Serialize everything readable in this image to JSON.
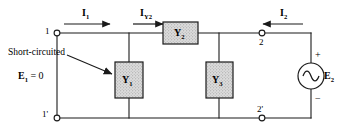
{
  "figure": {
    "type": "electrical-circuit-diagram",
    "background_color": "#ffffff",
    "line_color": "#1a1a1a",
    "component_fill": "#d9d9d9"
  },
  "terminals": [
    {
      "id": "t1",
      "label": "1",
      "x": 57,
      "y": 33,
      "side": "top-left"
    },
    {
      "id": "t1p",
      "label": "1'",
      "x": 57,
      "y": 118,
      "side": "bottom-left"
    },
    {
      "id": "t2",
      "label": "2",
      "x": 262,
      "y": 33,
      "side": "top-right"
    },
    {
      "id": "t2p",
      "label": "2'",
      "x": 262,
      "y": 118,
      "side": "bottom-right"
    }
  ],
  "currents": [
    {
      "id": "i1",
      "label": "I",
      "subscript": "1",
      "direction": "right",
      "x": 83,
      "y": 17
    },
    {
      "id": "iy2",
      "label": "I",
      "subscript": "Y2",
      "direction": "right",
      "x": 148,
      "y": 17
    },
    {
      "id": "i2",
      "label": "I",
      "subscript": "2",
      "direction": "left",
      "x": 283,
      "y": 17
    }
  ],
  "components": [
    {
      "id": "y1",
      "label": "Y",
      "subscript": "1",
      "orientation": "vertical",
      "x": 129,
      "y": 80
    },
    {
      "id": "y2",
      "label": "Y",
      "subscript": "2",
      "orientation": "horizontal",
      "x": 180,
      "y": 33
    },
    {
      "id": "y3",
      "label": "Y",
      "subscript": "3",
      "orientation": "vertical",
      "x": 219,
      "y": 80
    }
  ],
  "source": {
    "id": "e2",
    "type": "ac-voltage-source",
    "label": "E",
    "subscript": "2",
    "plus_sign": "+",
    "minus_sign": "−",
    "x": 311,
    "y": 76
  },
  "annotations": {
    "short_circuit_note": "Short-circuited",
    "input_voltage": "E",
    "input_voltage_subscript": "1",
    "input_voltage_equals": "= 0"
  }
}
